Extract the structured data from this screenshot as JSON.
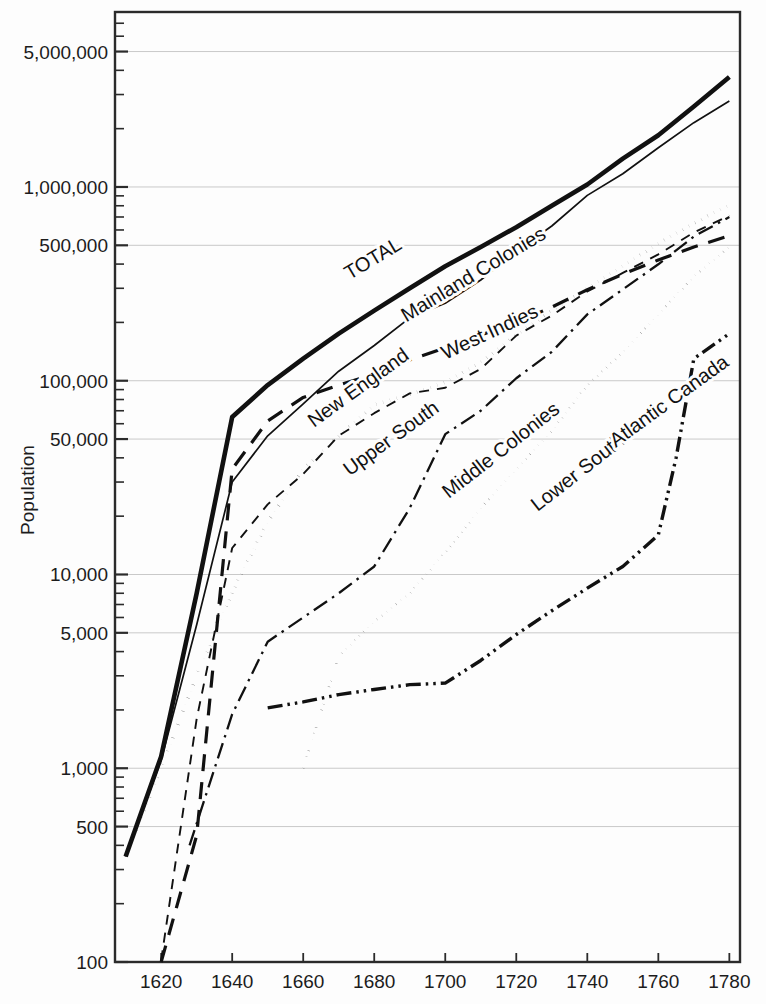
{
  "chart_data": {
    "type": "line",
    "title": "",
    "xlabel": "",
    "ylabel": "Population",
    "yscale": "log",
    "ylim": [
      100,
      8000000
    ],
    "xlim": [
      1607,
      1783
    ],
    "grid": true,
    "legend": "inline-labels",
    "x_ticks": [
      1620,
      1640,
      1660,
      1680,
      1700,
      1720,
      1740,
      1760,
      1780
    ],
    "x_tick_labels": [
      "1620",
      "1640",
      "1660",
      "1680",
      "1700",
      "1720",
      "1740",
      "1760",
      "1780"
    ],
    "y_ticks": [
      100,
      500,
      1000,
      5000,
      10000,
      50000,
      100000,
      500000,
      1000000,
      5000000
    ],
    "y_tick_labels": [
      "100",
      "500",
      "1,000",
      "5,000",
      "10,000",
      "50,000",
      "100,000",
      "500,000",
      "1,000,000",
      "5,000,000"
    ],
    "series": [
      {
        "name": "TOTAL",
        "style": "solid-thick",
        "label": "TOTAL",
        "label_x": 1673,
        "label_y": 330000,
        "label_rotation": -31,
        "x": [
          1610,
          1620,
          1630,
          1640,
          1650,
          1660,
          1670,
          1680,
          1690,
          1700,
          1710,
          1720,
          1730,
          1740,
          1750,
          1760,
          1770,
          1780
        ],
        "y": [
          350,
          1150,
          8000,
          65000,
          95000,
          130000,
          175000,
          230000,
          300000,
          390000,
          490000,
          620000,
          800000,
          1030000,
          1400000,
          1850000,
          2600000,
          3700000
        ]
      },
      {
        "name": "Mainland Colonies",
        "style": "solid-thin",
        "label": "Mainland Colonies",
        "label_x": 1689,
        "label_y": 200000,
        "label_rotation": -31,
        "x": [
          1610,
          1620,
          1630,
          1640,
          1650,
          1660,
          1670,
          1680,
          1690,
          1700,
          1710,
          1720,
          1730,
          1740,
          1750,
          1760,
          1770,
          1780
        ],
        "y": [
          350,
          1100,
          5500,
          30000,
          52000,
          76000,
          112000,
          152000,
          211000,
          251000,
          331000,
          466000,
          629000,
          905000,
          1170000,
          1594000,
          2148000,
          2780000
        ]
      },
      {
        "name": "West Indies",
        "style": "dashed",
        "label": "West Indies",
        "label_x": 1700,
        "label_y": 128000,
        "label_rotation": -25,
        "x": [
          1620,
          1630,
          1640,
          1650,
          1660,
          1670,
          1680,
          1690,
          1700,
          1710,
          1720,
          1730,
          1740,
          1750,
          1760,
          1770,
          1780
        ],
        "y": [
          100,
          450,
          35000,
          62000,
          82000,
          95000,
          108000,
          128000,
          148000,
          172000,
          200000,
          240000,
          295000,
          355000,
          420000,
          490000,
          560000
        ]
      },
      {
        "name": "New England",
        "style": "dashed-thin",
        "label": "New England",
        "label_x": 1663,
        "label_y": 57000,
        "label_rotation": -36,
        "x": [
          1620,
          1630,
          1640,
          1650,
          1660,
          1670,
          1680,
          1690,
          1700,
          1710,
          1720,
          1730,
          1740,
          1750,
          1760,
          1770,
          1780
        ],
        "y": [
          102,
          1800,
          13700,
          23000,
          33000,
          52000,
          68000,
          86000,
          92000,
          115000,
          171000,
          217000,
          289000,
          360000,
          449000,
          582000,
          712000
        ]
      },
      {
        "name": "Upper South",
        "style": "dotted-thick",
        "label": "Upper South",
        "label_x": 1673,
        "label_y": 32000,
        "label_rotation": -36,
        "x": [
          1610,
          1620,
          1630,
          1640,
          1650,
          1660,
          1670,
          1680,
          1690,
          1700,
          1710,
          1720,
          1730,
          1740,
          1750,
          1760,
          1770,
          1780
        ],
        "y": [
          350,
          1000,
          3000,
          8100,
          18700,
          35000,
          52000,
          75000,
          85000,
          98000,
          125000,
          172000,
          230000,
          300000,
          390000,
          510000,
          650000,
          810000
        ]
      },
      {
        "name": "Middle Colonies",
        "style": "dash-dot",
        "label": "Middle Colonies",
        "label_x": 1701,
        "label_y": 24500,
        "label_rotation": -38,
        "x": [
          1628,
          1640,
          1650,
          1660,
          1670,
          1680,
          1690,
          1700,
          1710,
          1720,
          1730,
          1740,
          1750,
          1760,
          1770,
          1780
        ],
        "y": [
          400,
          1900,
          4500,
          6000,
          8000,
          11000,
          22000,
          53000,
          70000,
          103000,
          141000,
          220000,
          296000,
          399000,
          555000,
          700000
        ]
      },
      {
        "name": "Lower South",
        "style": "dotted-thin",
        "label": "Lower South",
        "label_x": 1726,
        "label_y": 21000,
        "label_rotation": -38,
        "x": [
          1660,
          1670,
          1680,
          1690,
          1700,
          1710,
          1720,
          1730,
          1740,
          1750,
          1760,
          1770,
          1780
        ],
        "y": [
          1000,
          3800,
          5700,
          8000,
          13000,
          22000,
          35000,
          55000,
          95000,
          140000,
          220000,
          345000,
          490000
        ]
      },
      {
        "name": "Atlantic Canada",
        "style": "dash-dot-dot",
        "label": "Atlantic Canada",
        "label_x": 1748,
        "label_y": 45000,
        "label_rotation": -36,
        "x": [
          1650,
          1660,
          1670,
          1680,
          1690,
          1700,
          1710,
          1720,
          1730,
          1740,
          1750,
          1760,
          1765,
          1770,
          1780
        ],
        "y": [
          2050,
          2200,
          2400,
          2550,
          2700,
          2750,
          3600,
          4900,
          6500,
          8500,
          11000,
          16000,
          40000,
          130000,
          175000
        ]
      }
    ]
  }
}
